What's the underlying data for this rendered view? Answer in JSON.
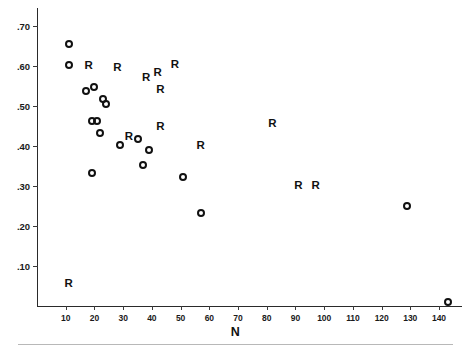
{
  "chart_data": {
    "type": "scatter",
    "title": "",
    "xlabel": "N",
    "ylabel": "",
    "xlim": [
      0,
      148
    ],
    "ylim": [
      0,
      0.745
    ],
    "grid": false,
    "legend": null,
    "xticks": [
      10,
      20,
      30,
      40,
      50,
      60,
      70,
      80,
      90,
      100,
      110,
      120,
      130,
      140
    ],
    "xtick_labels": [
      "10",
      "20",
      "30",
      "40",
      "50",
      "60",
      "70",
      "80",
      "90",
      "100",
      "110",
      "120",
      "130",
      "140"
    ],
    "yticks": [
      0.1,
      0.2,
      0.3,
      0.4,
      0.5,
      0.6,
      0.7
    ],
    "ytick_labels": [
      ".10",
      ".20",
      ".30",
      ".40",
      ".50",
      ".60",
      ".70"
    ],
    "series": [
      {
        "name": "O",
        "marker": "open-circle",
        "points": [
          {
            "x": 11,
            "y": 0.655
          },
          {
            "x": 11,
            "y": 0.602
          },
          {
            "x": 17,
            "y": 0.537
          },
          {
            "x": 20,
            "y": 0.548
          },
          {
            "x": 23,
            "y": 0.518
          },
          {
            "x": 24,
            "y": 0.505
          },
          {
            "x": 19,
            "y": 0.462
          },
          {
            "x": 21,
            "y": 0.462
          },
          {
            "x": 22,
            "y": 0.432
          },
          {
            "x": 19,
            "y": 0.332
          },
          {
            "x": 29,
            "y": 0.402
          },
          {
            "x": 35,
            "y": 0.418
          },
          {
            "x": 39,
            "y": 0.39
          },
          {
            "x": 37,
            "y": 0.352
          },
          {
            "x": 51,
            "y": 0.322
          },
          {
            "x": 57,
            "y": 0.233
          },
          {
            "x": 129,
            "y": 0.25
          },
          {
            "x": 143,
            "y": 0.01
          }
        ]
      },
      {
        "name": "R",
        "marker": "letter-R",
        "points": [
          {
            "x": 18,
            "y": 0.6
          },
          {
            "x": 28,
            "y": 0.595
          },
          {
            "x": 38,
            "y": 0.57
          },
          {
            "x": 42,
            "y": 0.582
          },
          {
            "x": 48,
            "y": 0.602
          },
          {
            "x": 43,
            "y": 0.54
          },
          {
            "x": 32,
            "y": 0.422
          },
          {
            "x": 43,
            "y": 0.447
          },
          {
            "x": 57,
            "y": 0.4
          },
          {
            "x": 82,
            "y": 0.455
          },
          {
            "x": 91,
            "y": 0.3
          },
          {
            "x": 97,
            "y": 0.3
          },
          {
            "x": 11,
            "y": 0.055
          }
        ]
      }
    ]
  }
}
